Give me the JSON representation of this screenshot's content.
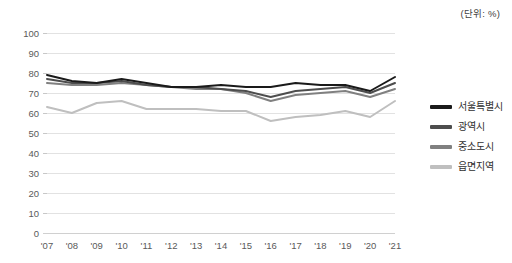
{
  "annotation": {
    "unit_label": "(단위: %)"
  },
  "legend": {
    "position": "right",
    "items": [
      {
        "label": "서울특별시",
        "color": "#1a1a1a"
      },
      {
        "label": "광역시",
        "color": "#4d4d4d"
      },
      {
        "label": "중소도시",
        "color": "#808080"
      },
      {
        "label": "읍면지역",
        "color": "#bfbfbf"
      }
    ]
  },
  "chart_data": {
    "type": "line",
    "title": "",
    "subtitle": "",
    "xlabel": "",
    "ylabel": "",
    "unit": "%",
    "grid": true,
    "legend_position": "right",
    "ylim": [
      0,
      100
    ],
    "yticks": [
      0,
      10,
      20,
      30,
      40,
      50,
      60,
      70,
      80,
      90,
      100
    ],
    "ytick_labels": [
      "0",
      "10",
      "20",
      "30",
      "40",
      "50",
      "60",
      "70",
      "80",
      "90",
      "100"
    ],
    "categories": [
      "'07",
      "'08",
      "'09",
      "'10",
      "'11",
      "'12",
      "'13",
      "'14",
      "'15",
      "'16",
      "'17",
      "'18",
      "'19",
      "'20",
      "'21"
    ],
    "x": [
      2007,
      2008,
      2009,
      2010,
      2011,
      2012,
      2013,
      2014,
      2015,
      2016,
      2017,
      2018,
      2019,
      2020,
      2021
    ],
    "series": [
      {
        "name": "서울특별시",
        "color": "#1a1a1a",
        "values": [
          79,
          76,
          75,
          77,
          75,
          73,
          73,
          74,
          73,
          73,
          75,
          74,
          74,
          71,
          78
        ]
      },
      {
        "name": "광역시",
        "color": "#4d4d4d",
        "values": [
          77,
          75,
          75,
          76,
          74,
          73,
          73,
          72,
          71,
          68,
          71,
          72,
          73,
          70,
          75
        ]
      },
      {
        "name": "중소도시",
        "color": "#808080",
        "values": [
          75,
          74,
          74,
          75,
          74,
          73,
          72,
          72,
          70,
          66,
          69,
          70,
          71,
          68,
          72
        ]
      },
      {
        "name": "읍면지역",
        "color": "#bfbfbf",
        "values": [
          63,
          60,
          65,
          66,
          62,
          62,
          62,
          61,
          61,
          56,
          58,
          59,
          61,
          58,
          66
        ]
      }
    ]
  }
}
